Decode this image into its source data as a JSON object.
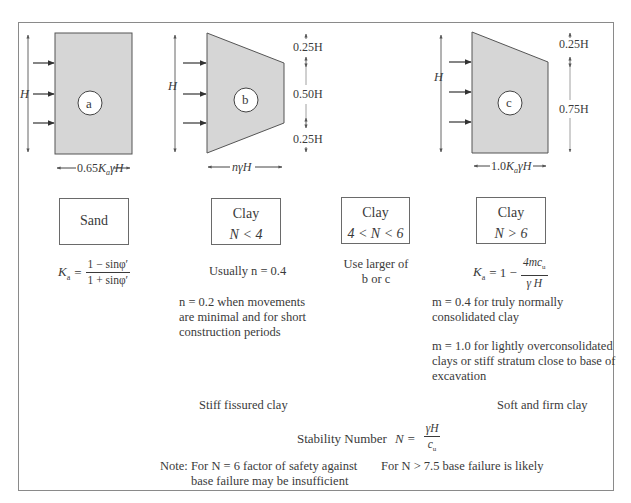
{
  "diagrams": [
    {
      "id": "a",
      "label": "a",
      "height_label": "H",
      "width_label_prefix": "0.65",
      "width_label_K": "K",
      "width_label_sub": "a",
      "width_label_suffix": "γH"
    },
    {
      "id": "b",
      "label": "b",
      "height_label": "H",
      "width_label": "nγH",
      "dimensions": [
        "0.25H",
        "0.50H",
        "0.25H"
      ]
    },
    {
      "id": "c",
      "label": "c",
      "height_label": "H",
      "width_label_prefix": "1.0",
      "width_label_K": "K",
      "width_label_sub": "a",
      "width_label_suffix": "γH",
      "dimensions": [
        "0.25H",
        "0.75H"
      ]
    }
  ],
  "boxes": [
    {
      "title": "Sand",
      "condition": ""
    },
    {
      "title": "Clay",
      "condition": "N < 4"
    },
    {
      "title": "Clay",
      "condition": "4 < N < 6"
    },
    {
      "title": "Clay",
      "condition": "N > 6"
    }
  ],
  "sand_formula": {
    "lhs": "K",
    "lhs_sub": "a",
    "eq": "=",
    "numerator": "1 − sinφ′",
    "denominator": "1 + sinφ′"
  },
  "clay_n4": {
    "usual": "Usually n = 0.4",
    "note_lines": [
      "n = 0.2 when movements",
      "are minimal and for short",
      "construction periods"
    ]
  },
  "clay_n46": {
    "lines": [
      "Use larger of",
      "b or c"
    ]
  },
  "clay_n6": {
    "formula": {
      "lhs": "K",
      "lhs_sub": "a",
      "eq": "= 1 −",
      "numerator": "4mc",
      "numerator_sub": "u",
      "denominator": "γ H"
    },
    "note1_lines": [
      "m = 0.4 for truly normally",
      "consolidated clay"
    ],
    "note2_lines": [
      "m = 1.0 for lightly overconsolidated",
      "clays or stiff stratum close to base of",
      "excavation"
    ]
  },
  "category_labels": {
    "stiff": "Stiff fissured clay",
    "soft": "Soft and firm clay"
  },
  "stability": {
    "label": "Stability Number",
    "lhs": "N =",
    "numerator": "γH",
    "denominator": "c",
    "denominator_sub": "u"
  },
  "notes": {
    "left_lines": [
      "Note: For N = 6 factor of safety against",
      "base failure may be insufficient"
    ],
    "right": "For  N > 7.5 base failure is likely"
  },
  "colors": {
    "fill": "#d6d6d6",
    "stroke": "#555555",
    "frame": "#8a8a8a"
  }
}
